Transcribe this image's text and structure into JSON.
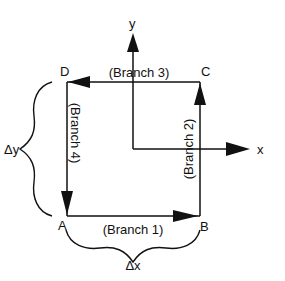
{
  "diagram": {
    "title": "",
    "nodes": [
      {
        "id": "A",
        "label": "A"
      },
      {
        "id": "B",
        "label": "B"
      },
      {
        "id": "C",
        "label": "C"
      },
      {
        "id": "D",
        "label": "D"
      }
    ],
    "branches": [
      {
        "id": "branch1",
        "label": "(Branch 1)",
        "from": "A",
        "to": "B"
      },
      {
        "id": "branch2",
        "label": "(Branch 2)",
        "from": "B",
        "to": "C"
      },
      {
        "id": "branch3",
        "label": "(Branch 3)",
        "from": "C",
        "to": "D"
      },
      {
        "id": "branch4",
        "label": "(Branch 4)",
        "from": "D",
        "to": "A"
      }
    ],
    "axes": {
      "x_label": "x",
      "y_label": "y"
    },
    "dimensions": {
      "dx_label": "Δx",
      "dy_label": "Δy"
    },
    "colors": {
      "stroke": "#111111",
      "background": "#ffffff"
    }
  }
}
